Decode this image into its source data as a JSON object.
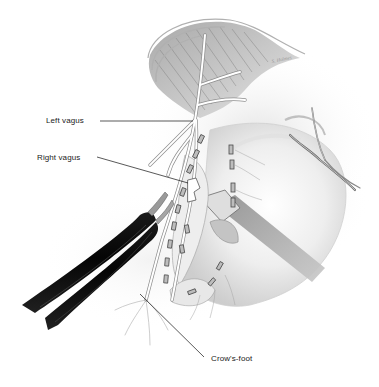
{
  "figure": {
    "style": "grayscale pencil/airbrush medical illustration",
    "background_color": "#ffffff",
    "label_color": "#1a1a1a",
    "instrument_color": "#0d0d0d"
  },
  "labels": [
    {
      "id": "left-vagus",
      "text": "Left vagus",
      "x": 46,
      "y": 116,
      "leader": {
        "x1": 100,
        "y1": 121,
        "x2": 193,
        "y2": 121
      }
    },
    {
      "id": "right-vagus",
      "text": "Right vagus",
      "x": 37,
      "y": 153,
      "leader": {
        "x1": 97,
        "y1": 157,
        "x2": 188,
        "y2": 183
      }
    },
    {
      "id": "crows-foot",
      "text": "Crow's-foot",
      "x": 211,
      "y": 354,
      "leader": {
        "x1": 140,
        "y1": 294,
        "x2": 204,
        "y2": 357
      }
    }
  ],
  "signature": "S. Holmes"
}
